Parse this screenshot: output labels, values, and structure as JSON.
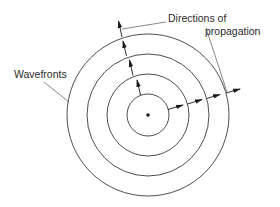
{
  "diagram": {
    "type": "concentric-wavefronts",
    "labels": {
      "wavefronts": "Wavefronts",
      "directions_line1": "Directions of",
      "directions_line2": "propagation"
    },
    "center": {
      "x": 148,
      "y": 115
    },
    "radii": [
      21,
      41,
      61,
      81
    ],
    "colors": {
      "stroke": "#3a3a3a",
      "arrow": "#1a1a1a",
      "background": "#ffffff"
    }
  }
}
